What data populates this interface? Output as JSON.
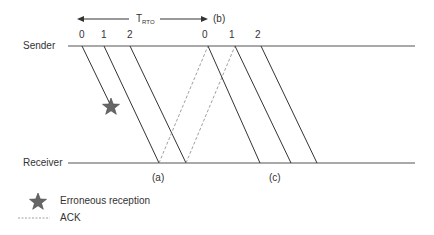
{
  "diagram": {
    "type": "sequence-timing",
    "actors": {
      "sender": "Sender",
      "receiver": "Receiver"
    },
    "timer": {
      "symbol": "T",
      "subscript": "RTO",
      "end_marker": "(b)"
    },
    "frames_initial": [
      "0",
      "1",
      "2"
    ],
    "frames_retransmit": [
      "0",
      "1",
      "2"
    ],
    "markers": {
      "a": "(a)",
      "c": "(c)"
    },
    "legend": {
      "error_label": "Erroneous reception",
      "ack_label": "ACK"
    },
    "colors": {
      "line": "#333333",
      "ack": "#888888",
      "star": "#666666"
    }
  }
}
